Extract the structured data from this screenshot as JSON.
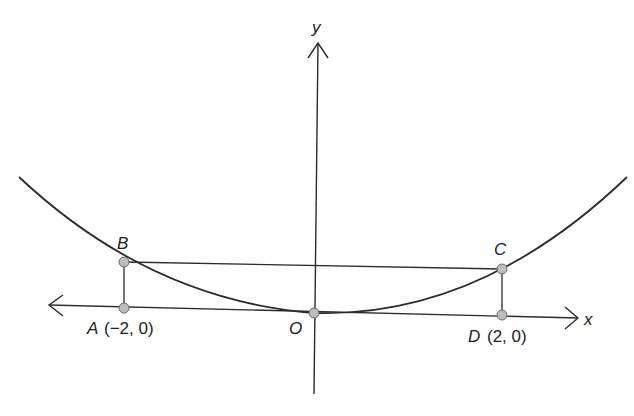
{
  "diagram": {
    "axes": {
      "x_label": "x",
      "y_label": "y",
      "origin_label": "O"
    },
    "points": {
      "A": {
        "label": "A",
        "coords": "(−2, 0)"
      },
      "B": {
        "label": "B"
      },
      "C": {
        "label": "C"
      },
      "D": {
        "label": "D",
        "coords": "(2, 0)"
      },
      "O": {
        "label": "O"
      }
    },
    "colors": {
      "line": "#2b2b2b",
      "point_fill": "#bdbdbd",
      "point_stroke": "#6a6a6a"
    }
  }
}
